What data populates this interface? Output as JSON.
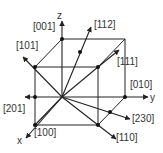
{
  "diagram": {
    "type": "crystallographic-directions-cube",
    "axes": {
      "x": "x",
      "y": "y",
      "z": "z"
    },
    "directions": [
      {
        "id": "001",
        "label": "[001]"
      },
      {
        "id": "112",
        "label": "[112]"
      },
      {
        "id": "101",
        "label": "[101]"
      },
      {
        "id": "111",
        "label": "[111]"
      },
      {
        "id": "010",
        "label": "[010]"
      },
      {
        "id": "201",
        "label": "[201]"
      },
      {
        "id": "230",
        "label": "[230]"
      },
      {
        "id": "100",
        "label": "[100]"
      },
      {
        "id": "110",
        "label": "[110]"
      }
    ],
    "colors": {
      "line": "#222222",
      "text": "#333333",
      "background": "#ffffff"
    }
  }
}
